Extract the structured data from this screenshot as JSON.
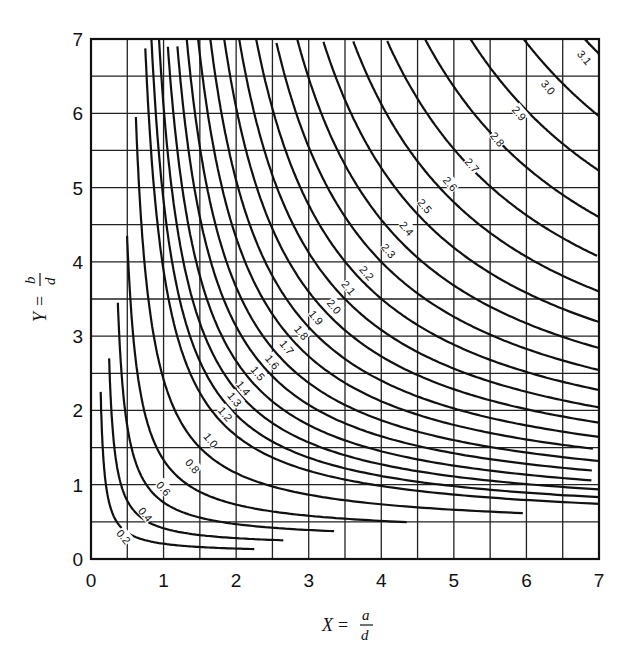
{
  "chart_data": {
    "type": "line",
    "title": "",
    "xlabel": "X = a/d",
    "ylabel": "Y = b/d",
    "xlabel_parts": {
      "var": "X",
      "eq": "=",
      "num": "a",
      "den": "d"
    },
    "ylabel_parts": {
      "var": "Y",
      "eq": "=",
      "num": "b",
      "den": "d"
    },
    "xlim": [
      0,
      7
    ],
    "ylim": [
      0,
      7
    ],
    "xticks": [
      "0",
      "1",
      "2",
      "3",
      "4",
      "5",
      "6",
      "7"
    ],
    "yticks": [
      "0",
      "1",
      "2",
      "3",
      "4",
      "5",
      "6",
      "7"
    ],
    "grid": {
      "on": true,
      "step": 0.5
    },
    "legend": "none",
    "series": [
      {
        "name": "0.2",
        "diag": 0.42,
        "asym": 0.08,
        "xend": 2.25,
        "yend": 2.25
      },
      {
        "name": "0.4",
        "diag": 0.62,
        "asym": 0.17,
        "xend": 2.65,
        "yend": 2.7
      },
      {
        "name": "0.6",
        "diag": 0.87,
        "asym": 0.25,
        "xend": 3.35,
        "yend": 3.45
      },
      {
        "name": "0.8",
        "diag": 1.15,
        "asym": 0.33,
        "xend": 4.35,
        "yend": 4.35
      },
      {
        "name": "1.0",
        "diag": 1.5,
        "asym": 0.4,
        "xend": 5.95,
        "yend": 5.95
      },
      {
        "name": "1.2",
        "diag": 1.82,
        "asym": 0.46,
        "xend": 7,
        "yend": 7
      },
      {
        "name": "1.3",
        "diag": 1.97,
        "asym": 0.5,
        "xend": 7,
        "yend": 7
      },
      {
        "name": "1.4",
        "diag": 2.13,
        "asym": 0.55,
        "xend": 7,
        "yend": 7
      },
      {
        "name": "1.5",
        "diag": 2.3,
        "asym": 0.6,
        "xend": 7,
        "yend": 7
      },
      {
        "name": "1.6",
        "diag": 2.48,
        "asym": 0.66,
        "xend": 7,
        "yend": 7
      },
      {
        "name": "1.7",
        "diag": 2.66,
        "asym": 0.72,
        "xend": 7,
        "yend": 7
      },
      {
        "name": "1.8",
        "diag": 2.86,
        "asym": 0.78,
        "xend": 7,
        "yend": 7
      },
      {
        "name": "1.9",
        "diag": 3.06,
        "asym": 0.85,
        "xend": 7,
        "yend": 7
      },
      {
        "name": "2.0",
        "diag": 3.28,
        "asym": 0.92,
        "xend": 7,
        "yend": 7
      },
      {
        "name": "2.1",
        "diag": 3.5,
        "asym": 1.0,
        "xend": 7,
        "yend": 7
      },
      {
        "name": "2.2",
        "diag": 3.74,
        "asym": 1.08,
        "xend": 7,
        "yend": 7
      },
      {
        "name": "2.3",
        "diag": 4.0,
        "asym": 1.17,
        "xend": 7,
        "yend": 7
      },
      {
        "name": "2.4",
        "diag": 4.27,
        "asym": 1.27,
        "xend": 7,
        "yend": 7
      },
      {
        "name": "2.5",
        "diag": 4.57,
        "asym": 1.38,
        "xend": 7,
        "yend": 7
      },
      {
        "name": "2.6",
        "diag": 4.9,
        "asym": 1.5,
        "xend": 7,
        "yend": 7
      },
      {
        "name": "2.7",
        "diag": 5.25,
        "asym": 1.62,
        "xend": 7,
        "yend": 7
      },
      {
        "name": "2.8",
        "diag": 5.62,
        "asym": 1.75,
        "xend": 7,
        "yend": 7
      },
      {
        "name": "2.9",
        "diag": 6.02,
        "asym": 1.9,
        "xend": 7,
        "yend": 7
      },
      {
        "name": "3.0",
        "diag": 6.45,
        "asym": 2.05,
        "xend": 7,
        "yend": 7
      },
      {
        "name": "3.1",
        "diag": 6.9,
        "asym": 2.2,
        "xend": 7,
        "yend": 7
      }
    ],
    "label_positions": [
      {
        "text": "0.2",
        "x": 0.45,
        "y": 0.3
      },
      {
        "text": "0.4",
        "x": 0.75,
        "y": 0.6
      },
      {
        "text": "0.6",
        "x": 1.0,
        "y": 0.95
      },
      {
        "text": "0.8",
        "x": 1.4,
        "y": 1.25
      },
      {
        "text": "1.0",
        "x": 1.65,
        "y": 1.6
      },
      {
        "text": "1.2",
        "x": 1.85,
        "y": 1.95
      },
      {
        "text": "1.3",
        "x": 1.98,
        "y": 2.15
      },
      {
        "text": "1.4",
        "x": 2.1,
        "y": 2.3
      },
      {
        "text": "1.5",
        "x": 2.3,
        "y": 2.5
      },
      {
        "text": "1.6",
        "x": 2.5,
        "y": 2.65
      },
      {
        "text": "1.7",
        "x": 2.7,
        "y": 2.85
      },
      {
        "text": "1.8",
        "x": 2.9,
        "y": 3.05
      },
      {
        "text": "1.9",
        "x": 3.1,
        "y": 3.25
      },
      {
        "text": "2.0",
        "x": 3.35,
        "y": 3.4
      },
      {
        "text": "2.1",
        "x": 3.55,
        "y": 3.65
      },
      {
        "text": "2.2",
        "x": 3.8,
        "y": 3.85
      },
      {
        "text": "2.3",
        "x": 4.1,
        "y": 4.15
      },
      {
        "text": "2.4",
        "x": 4.35,
        "y": 4.45
      },
      {
        "text": "2.5",
        "x": 4.6,
        "y": 4.75
      },
      {
        "text": "2.6",
        "x": 4.95,
        "y": 5.05
      },
      {
        "text": "2.7",
        "x": 5.25,
        "y": 5.3
      },
      {
        "text": "2.8",
        "x": 5.6,
        "y": 5.65
      },
      {
        "text": "2.9",
        "x": 5.9,
        "y": 6.0
      },
      {
        "text": "3.0",
        "x": 6.3,
        "y": 6.35
      },
      {
        "text": "3.1",
        "x": 6.8,
        "y": 6.75
      }
    ]
  }
}
